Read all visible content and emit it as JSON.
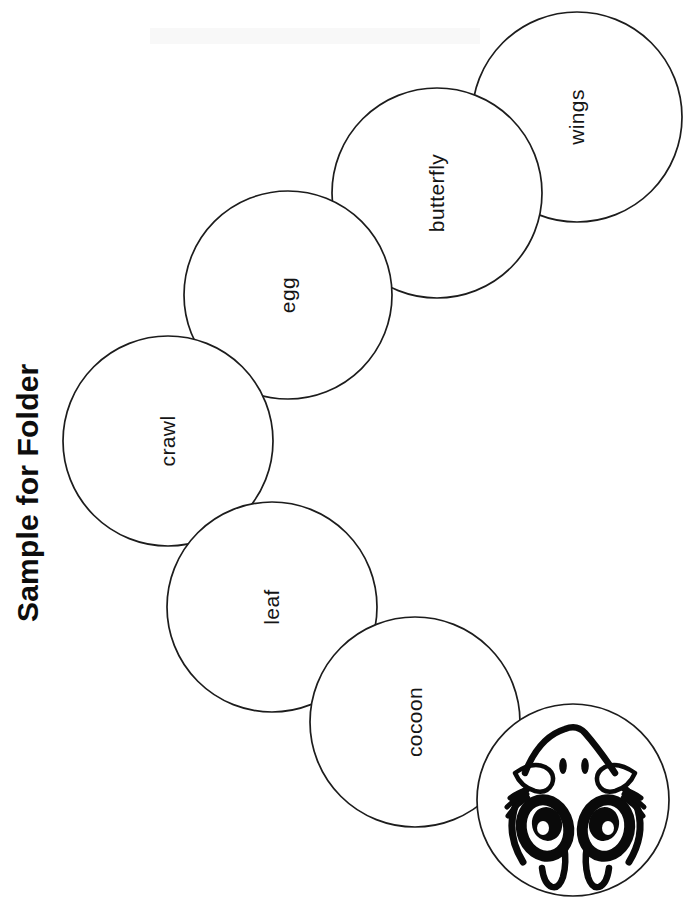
{
  "page": {
    "title": "Sample for Folder",
    "title_rotation_degrees": -90,
    "orientation": "rotated-90",
    "background_color": "#ffffff",
    "ink_color": "#1c1c1c",
    "width": 688,
    "height": 907
  },
  "worksheet": {
    "kind": "caterpillar-life-cycle-cutout",
    "segment_count": 6,
    "has_face_segment": true,
    "segments": [
      {
        "id": "wings",
        "label": "wings",
        "cx": 577,
        "cy": 117,
        "r": 105,
        "order": 1
      },
      {
        "id": "butterfly",
        "label": "butterfly",
        "cx": 437,
        "cy": 193,
        "r": 105,
        "order": 2
      },
      {
        "id": "egg",
        "label": "egg",
        "cx": 288,
        "cy": 295,
        "r": 104,
        "order": 3
      },
      {
        "id": "crawl",
        "label": "crawl",
        "cx": 168,
        "cy": 441,
        "r": 105,
        "order": 4
      },
      {
        "id": "leaf",
        "label": "leaf",
        "cx": 272,
        "cy": 607,
        "r": 105,
        "order": 5
      },
      {
        "id": "cocoon",
        "label": "cocoon",
        "cx": 415,
        "cy": 722,
        "r": 105,
        "order": 6
      }
    ],
    "face": {
      "id": "face",
      "label": "caterpillar-face",
      "cx": 573,
      "cy": 800,
      "r": 96,
      "features": [
        "eye-upper",
        "eye-lower",
        "eyelash-upper",
        "eyelash-lower",
        "eyebrow-upper",
        "eyebrow-lower",
        "antenna-upper",
        "antenna-lower",
        "nostril-upper",
        "nostril-lower",
        "mouth"
      ]
    }
  }
}
